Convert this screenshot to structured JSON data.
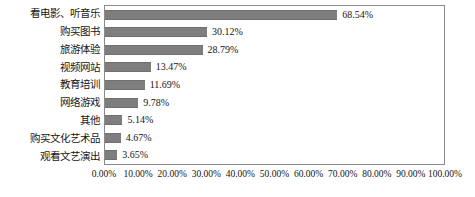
{
  "chart_data": {
    "type": "bar",
    "orientation": "horizontal",
    "title": "",
    "xlabel": "",
    "ylabel": "",
    "categories": [
      "看电影、听音乐",
      "购买图书",
      "旅游体验",
      "视频网站",
      "教育培训",
      "网络游戏",
      "其他",
      "购买文化艺术品",
      "观看文艺演出"
    ],
    "values": [
      68.54,
      30.12,
      28.79,
      13.47,
      11.69,
      9.78,
      5.14,
      4.67,
      3.65
    ],
    "value_labels": [
      "68.54%",
      "30.12%",
      "28.79%",
      "13.47%",
      "11.69%",
      "9.78%",
      "5.14%",
      "4.67%",
      "3.65%"
    ],
    "xlim": [
      0,
      100
    ],
    "xticks": [
      0,
      10,
      20,
      30,
      40,
      50,
      60,
      70,
      80,
      90,
      100
    ],
    "xtick_labels": [
      "0.00%",
      "10.00%",
      "20.00%",
      "30.00%",
      "40.00%",
      "50.00%",
      "60.00%",
      "70.00%",
      "80.00%",
      "90.00%",
      "100.00%"
    ],
    "grid": false,
    "legend": false,
    "series_color": "#7e7e7e",
    "frame_color": "#8a8a8a",
    "background_color": "#ffffff"
  }
}
